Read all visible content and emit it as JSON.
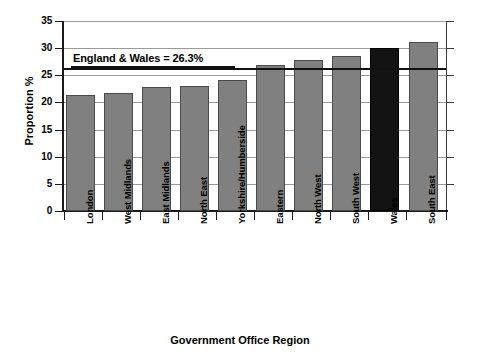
{
  "chart_data": {
    "type": "bar",
    "title": "",
    "xlabel": "Government Office Region",
    "ylabel": "Proportion %",
    "categories": [
      "London",
      "West Midlands",
      "East Midlands",
      "North East",
      "Yorkshire/Humberside",
      "Eastern",
      "North West",
      "South West",
      "Wales",
      "South East"
    ],
    "values": [
      21.3,
      21.8,
      22.9,
      23.1,
      24.1,
      26.9,
      27.8,
      28.5,
      30.0,
      31.1
    ],
    "bar_colors": [
      "#808080",
      "#808080",
      "#808080",
      "#808080",
      "#808080",
      "#808080",
      "#808080",
      "#808080",
      "#131313",
      "#808080"
    ],
    "highlight_category": "Wales",
    "highlight_color": "#131313",
    "bar_color": "#808080",
    "ylim": [
      0,
      35
    ],
    "ytick_values": [
      0,
      5,
      10,
      15,
      20,
      25,
      30,
      35
    ],
    "ytick_labels": [
      "0",
      "5",
      "10",
      "15",
      "20",
      "25",
      "30",
      "35"
    ],
    "grid": true,
    "grid_axis": "y",
    "legend": "none",
    "annotations": [
      {
        "name": "england-wales-reference",
        "text": "England & Wales = 26.3%",
        "value": 26.3,
        "line_color": "#111111"
      }
    ]
  }
}
